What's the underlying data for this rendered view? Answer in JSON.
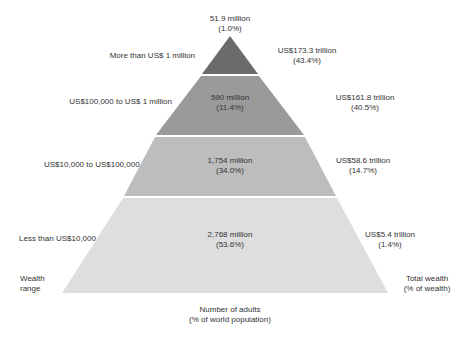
{
  "diagram": {
    "type": "wealth-pyramid",
    "colors": {
      "tier1": "#6b6b6b",
      "tier2": "#9a9a9a",
      "tier3": "#bdbdbd",
      "tier4": "#dedede",
      "text": "#333333"
    },
    "axis_labels": {
      "left_line1": "Wealth",
      "left_line2": "range",
      "right_line1": "Total wealth",
      "right_line2": "(% of wealth)",
      "bottom_line1": "Number of adults",
      "bottom_line2": "(% of world population)"
    },
    "tiers": [
      {
        "range": "More than US$ 1 million",
        "adults": "51.9 million",
        "adults_pct": "(1.0%)",
        "wealth": "US$173.3 trillion",
        "wealth_pct": "(43.4%)"
      },
      {
        "range": "US$100,000 to US$ 1 million",
        "adults": "590 million",
        "adults_pct": "(11.4%)",
        "wealth": "US$161.8 trillion",
        "wealth_pct": "(40.5%)"
      },
      {
        "range": "US$10,000 to US$100,000",
        "adults": "1,754 million",
        "adults_pct": "(34.0%)",
        "wealth": "US$58.6 trillion",
        "wealth_pct": "(14.7%)"
      },
      {
        "range": "Less than US$10,000",
        "adults": "2,768 million",
        "adults_pct": "(53.6%)",
        "wealth": "US$5.4 trillion",
        "wealth_pct": "(1.4%)"
      }
    ]
  }
}
